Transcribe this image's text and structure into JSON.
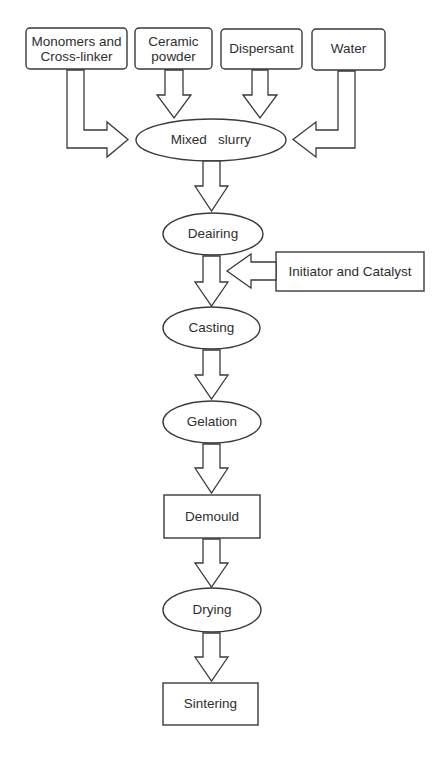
{
  "diagram": {
    "type": "process-flowchart",
    "inputs": [
      {
        "id": "monomers",
        "label_line1": "Monomers and",
        "label_line2": "Cross-linker",
        "shape": "rounded-rect"
      },
      {
        "id": "ceramic",
        "label_line1": "Ceramic",
        "label_line2": "powder",
        "shape": "rounded-rect"
      },
      {
        "id": "dispersant",
        "label": "Dispersant",
        "shape": "rounded-rect"
      },
      {
        "id": "water",
        "label": "Water",
        "shape": "rounded-rect"
      }
    ],
    "steps": [
      {
        "id": "mixed-slurry",
        "label": "Mixed   slurry",
        "shape": "ellipse"
      },
      {
        "id": "deairing",
        "label": "Deairing",
        "shape": "ellipse"
      },
      {
        "id": "casting",
        "label": "Casting",
        "shape": "ellipse"
      },
      {
        "id": "gelation",
        "label": "Gelation",
        "shape": "ellipse"
      },
      {
        "id": "demould",
        "label": "Demould",
        "shape": "rect"
      },
      {
        "id": "drying",
        "label": "Drying",
        "shape": "ellipse"
      },
      {
        "id": "sintering",
        "label": "Sintering",
        "shape": "rect"
      }
    ],
    "side_input": {
      "id": "initiator",
      "label": "Initiator and Catalyst",
      "shape": "rect",
      "enters_between": [
        "deairing",
        "casting"
      ]
    },
    "edges": [
      {
        "from": "monomers",
        "to": "mixed-slurry"
      },
      {
        "from": "ceramic",
        "to": "mixed-slurry"
      },
      {
        "from": "dispersant",
        "to": "mixed-slurry"
      },
      {
        "from": "water",
        "to": "mixed-slurry"
      },
      {
        "from": "mixed-slurry",
        "to": "deairing"
      },
      {
        "from": "deairing",
        "to": "casting"
      },
      {
        "from": "initiator",
        "to": "casting"
      },
      {
        "from": "casting",
        "to": "gelation"
      },
      {
        "from": "gelation",
        "to": "demould"
      },
      {
        "from": "demould",
        "to": "drying"
      },
      {
        "from": "drying",
        "to": "sintering"
      }
    ],
    "colors": {
      "stroke": "#3a3a3a",
      "text": "#2e2e2e",
      "background": "#ffffff"
    }
  }
}
